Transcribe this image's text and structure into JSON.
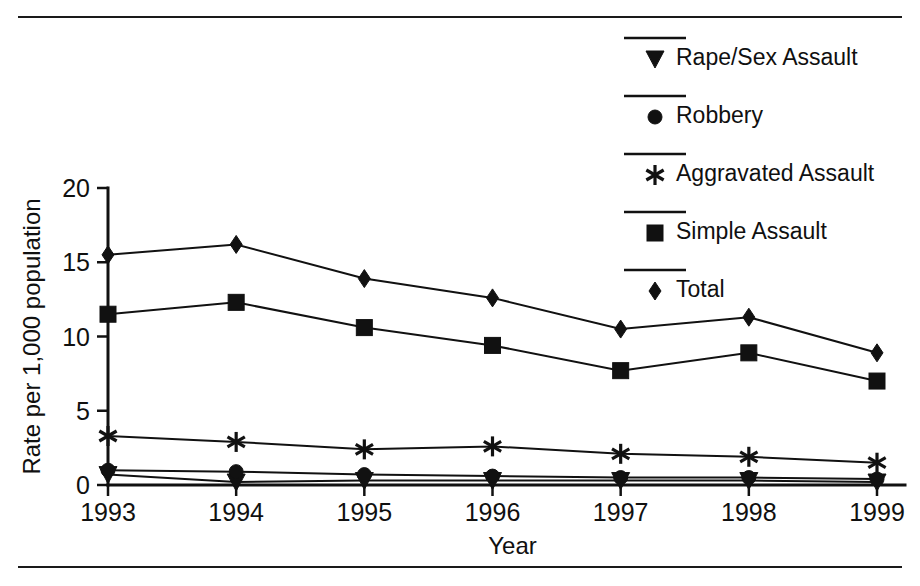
{
  "figure": {
    "has_top_rule": true,
    "has_bottom_rule": true,
    "background_color": "#ffffff",
    "ink_color": "#111111"
  },
  "chart_data": {
    "type": "line",
    "title": "",
    "subtitle": "",
    "xlabel": "Year",
    "ylabel": "Rate per 1,000 population",
    "categories": [
      "1993",
      "1994",
      "1995",
      "1996",
      "1997",
      "1998",
      "1999"
    ],
    "x": [
      1993,
      1994,
      1995,
      1996,
      1997,
      1998,
      1999
    ],
    "xlim": [
      1993,
      1999
    ],
    "ylim": [
      0,
      20
    ],
    "yticks": [
      0,
      5,
      10,
      15,
      20
    ],
    "ytick_labels": [
      "0",
      "5",
      "10",
      "15",
      "20"
    ],
    "xtick_labels": [
      "1993",
      "1994",
      "1995",
      "1996",
      "1997",
      "1998",
      "1999"
    ],
    "grid": false,
    "legend_position": "top-right",
    "series": [
      {
        "name": "Rape/Sex Assault",
        "marker": "triangle-down",
        "values": [
          0.7,
          0.2,
          0.3,
          0.3,
          0.3,
          0.3,
          0.2
        ]
      },
      {
        "name": "Robbery",
        "marker": "circle",
        "values": [
          1.0,
          0.9,
          0.7,
          0.6,
          0.5,
          0.5,
          0.4
        ]
      },
      {
        "name": "Aggravated Assault",
        "marker": "asterisk",
        "values": [
          3.3,
          2.9,
          2.4,
          2.6,
          2.1,
          1.9,
          1.5
        ]
      },
      {
        "name": "Simple Assault",
        "marker": "square",
        "values": [
          11.5,
          12.3,
          10.6,
          9.4,
          7.7,
          8.9,
          7.0
        ]
      },
      {
        "name": "Total",
        "marker": "diamond",
        "values": [
          15.5,
          16.2,
          13.9,
          12.6,
          10.5,
          11.3,
          8.9
        ]
      }
    ]
  },
  "legend": {
    "entries": [
      {
        "label": "Rape/Sex Assault",
        "marker": "triangle-down"
      },
      {
        "label": "Robbery",
        "marker": "circle"
      },
      {
        "label": "Aggravated Assault",
        "marker": "asterisk"
      },
      {
        "label": "Simple Assault",
        "marker": "square"
      },
      {
        "label": "Total",
        "marker": "diamond"
      }
    ]
  }
}
